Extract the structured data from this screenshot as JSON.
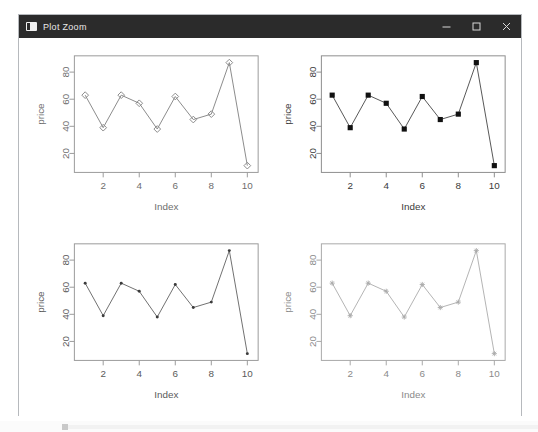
{
  "window": {
    "title": "Plot Zoom",
    "icon": "app-window-icon",
    "controls": {
      "minimize": "minimize-icon",
      "maximize": "maximize-icon",
      "close": "close-icon"
    },
    "titlebar_color": "#2b2b2b",
    "background_color": "#ffffff",
    "border_color": "#b6b9bd"
  },
  "chart_data": [
    {
      "id": "plot-top-left",
      "type": "line",
      "title": "",
      "xlabel": "Index",
      "ylabel": "price",
      "x": [
        1,
        2,
        3,
        4,
        5,
        6,
        7,
        8,
        9,
        10
      ],
      "values": [
        63,
        39,
        63,
        57,
        38,
        62,
        45,
        49,
        87,
        11
      ],
      "xticks": [
        2,
        4,
        6,
        8,
        10
      ],
      "yticks": [
        20,
        40,
        60,
        80
      ],
      "xlim": [
        0.4,
        10.6
      ],
      "ylim": [
        6,
        92
      ],
      "grid": false,
      "legend": "none",
      "marker": "open-diamond",
      "marker_color": "#8a8a8a",
      "line_color": "#8a8a8a",
      "box_color": "#9a9a9a",
      "text_color": "#6e6e6e"
    },
    {
      "id": "plot-top-right",
      "type": "line",
      "title": "",
      "xlabel": "Index",
      "ylabel": "price",
      "x": [
        1,
        2,
        3,
        4,
        5,
        6,
        7,
        8,
        9,
        10
      ],
      "values": [
        63,
        39,
        63,
        57,
        38,
        62,
        45,
        49,
        87,
        11
      ],
      "xticks": [
        2,
        4,
        6,
        8,
        10
      ],
      "yticks": [
        20,
        40,
        60,
        80
      ],
      "xlim": [
        0.4,
        10.6
      ],
      "ylim": [
        6,
        92
      ],
      "grid": false,
      "legend": "none",
      "marker": "filled-square",
      "marker_color": "#111111",
      "line_color": "#555555",
      "box_color": "#8d8d8d",
      "text_color": "#3a3a3a"
    },
    {
      "id": "plot-bottom-left",
      "type": "line",
      "title": "",
      "xlabel": "Index",
      "ylabel": "price",
      "x": [
        1,
        2,
        3,
        4,
        5,
        6,
        7,
        8,
        9,
        10
      ],
      "values": [
        63,
        39,
        63,
        57,
        38,
        62,
        45,
        49,
        87,
        11
      ],
      "xticks": [
        2,
        4,
        6,
        8,
        10
      ],
      "yticks": [
        20,
        40,
        60,
        80
      ],
      "xlim": [
        0.4,
        10.6
      ],
      "ylim": [
        6,
        92
      ],
      "grid": false,
      "legend": "none",
      "marker": "small-dot",
      "marker_color": "#3b3b3b",
      "line_color": "#6f6f6f",
      "box_color": "#9a9a9a",
      "text_color": "#5a5a5a"
    },
    {
      "id": "plot-bottom-right",
      "type": "line",
      "title": "",
      "xlabel": "Index",
      "ylabel": "price",
      "x": [
        1,
        2,
        3,
        4,
        5,
        6,
        7,
        8,
        9,
        10
      ],
      "values": [
        63,
        39,
        63,
        57,
        38,
        62,
        45,
        49,
        87,
        11
      ],
      "xticks": [
        2,
        4,
        6,
        8,
        10
      ],
      "yticks": [
        20,
        40,
        60,
        80
      ],
      "xlim": [
        0.4,
        10.6
      ],
      "ylim": [
        6,
        92
      ],
      "grid": false,
      "legend": "none",
      "marker": "star",
      "marker_color": "#a9a9a9",
      "line_color": "#b3b3b3",
      "box_color": "#a8a8a8",
      "text_color": "#8a8a8a"
    }
  ]
}
